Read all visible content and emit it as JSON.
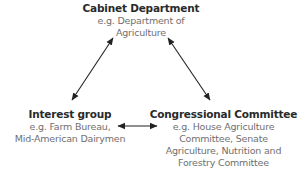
{
  "nodes": {
    "cabinet": {
      "title": "Cabinet Department",
      "lines": [
        "e.g. Department of",
        "Agriculture"
      ]
    },
    "interest": {
      "title": "Interest group",
      "lines": [
        "e.g. Farm Bureau,",
        "Mid-American Dairymen"
      ]
    },
    "congress": {
      "title": "Congressional Committee",
      "lines": [
        "e.g. House Agriculture",
        "Committee, Senate",
        "Agriculture, Nutrition and",
        "Forestry Committee"
      ]
    }
  },
  "edges": [
    {
      "from": "cabinet",
      "to": "interest",
      "type": "bidirectional-arrow"
    },
    {
      "from": "cabinet",
      "to": "congress",
      "type": "bidirectional-arrow"
    },
    {
      "from": "interest",
      "to": "congress",
      "type": "bidirectional-arrow"
    }
  ],
  "colors": {
    "title": "#2a2a2a",
    "subtitle": "#707070",
    "arrow": "#222222",
    "background": "#ffffff"
  }
}
